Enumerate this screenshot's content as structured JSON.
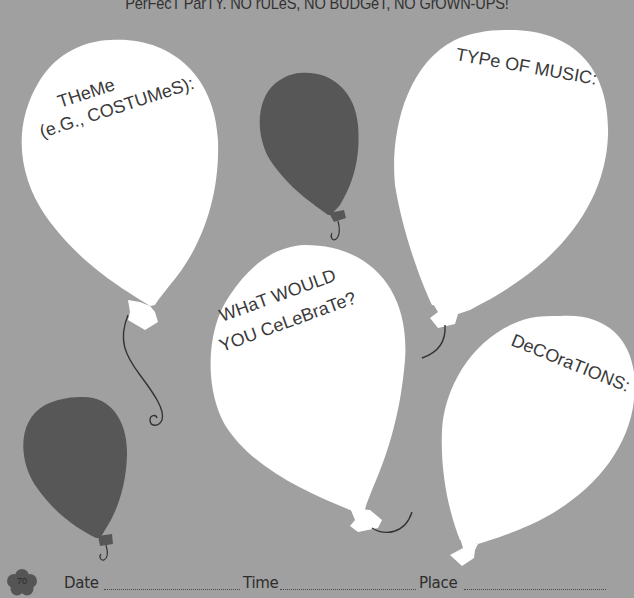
{
  "page": {
    "heading": "Perfect Party. No rules, no budget, no grown-ups!",
    "heading_display": "PerFecT ParTY. NO rULeS, NO BUDGeT, NO GrOWN-UPS!",
    "background_color": "#a0a0a0",
    "balloon_white": "#ffffff",
    "balloon_dark": "#575757",
    "string_color": "#333333"
  },
  "balloons": [
    {
      "id": "theme",
      "label_line1": "THeMe",
      "label_line2": "(e.G., COSTUMeS):",
      "color": "white"
    },
    {
      "id": "music",
      "label_line1": "TYPe OF MUSIC:",
      "color": "white"
    },
    {
      "id": "celebrate",
      "label_line1": "WHaT WOULD",
      "label_line2": "YOU CeLeBraTe?",
      "color": "white"
    },
    {
      "id": "decorations",
      "label_line1": "DeCOraTIONS:",
      "color": "white"
    },
    {
      "id": "dark-top",
      "color": "dark"
    },
    {
      "id": "dark-bottom",
      "color": "dark"
    }
  ],
  "footer": {
    "page_number": "70",
    "date_label": "Date",
    "time_label": "Time",
    "place_label": "Place"
  }
}
